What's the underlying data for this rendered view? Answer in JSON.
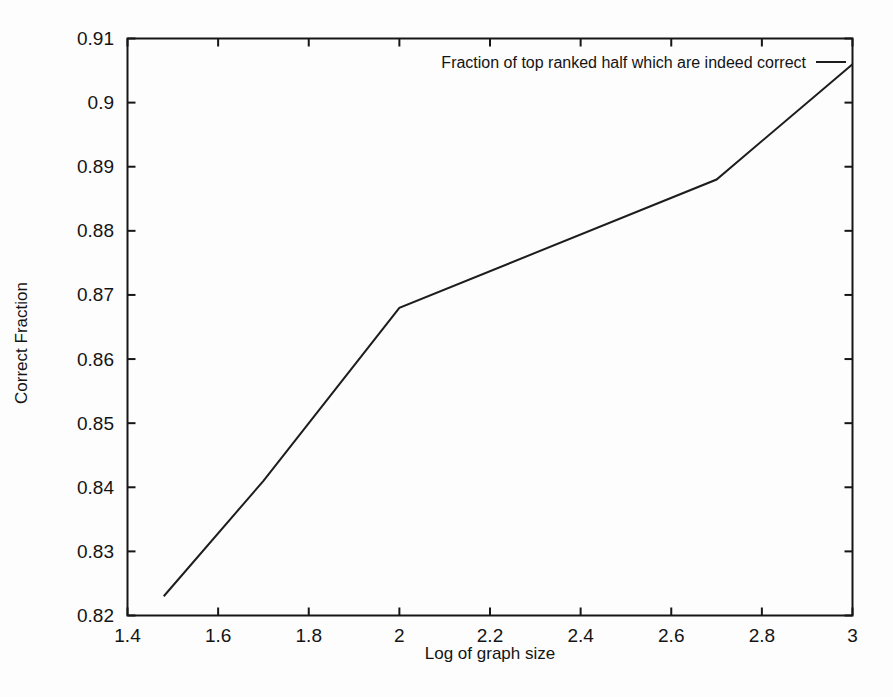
{
  "chart_data": {
    "type": "line",
    "title": "",
    "xlabel": "Log of graph size",
    "ylabel": "Correct Fraction",
    "xlim": [
      1.4,
      3.0
    ],
    "ylim": [
      0.82,
      0.91
    ],
    "x_ticks": [
      "1.4",
      "1.6",
      "1.8",
      "2",
      "2.2",
      "2.4",
      "2.6",
      "2.8",
      "3"
    ],
    "x_tick_values": [
      1.4,
      1.6,
      1.8,
      2.0,
      2.2,
      2.4,
      2.6,
      2.8,
      3.0
    ],
    "y_ticks": [
      "0.82",
      "0.83",
      "0.84",
      "0.85",
      "0.86",
      "0.87",
      "0.88",
      "0.89",
      "0.9",
      "0.91"
    ],
    "y_tick_values": [
      0.82,
      0.83,
      0.84,
      0.85,
      0.86,
      0.87,
      0.88,
      0.89,
      0.9,
      0.91
    ],
    "grid": false,
    "legend_position": "top-right-inside",
    "series": [
      {
        "name": "Fraction of top ranked half which are indeed correct",
        "x": [
          1.48,
          1.7,
          2.0,
          2.7,
          3.0
        ],
        "y": [
          0.823,
          0.841,
          0.868,
          0.888,
          0.906
        ],
        "color": "#1d1d1d"
      }
    ]
  },
  "colors": {
    "background": "#fdfdfd",
    "axis": "#161616",
    "text": "#141414",
    "line": "#1d1d1d"
  }
}
